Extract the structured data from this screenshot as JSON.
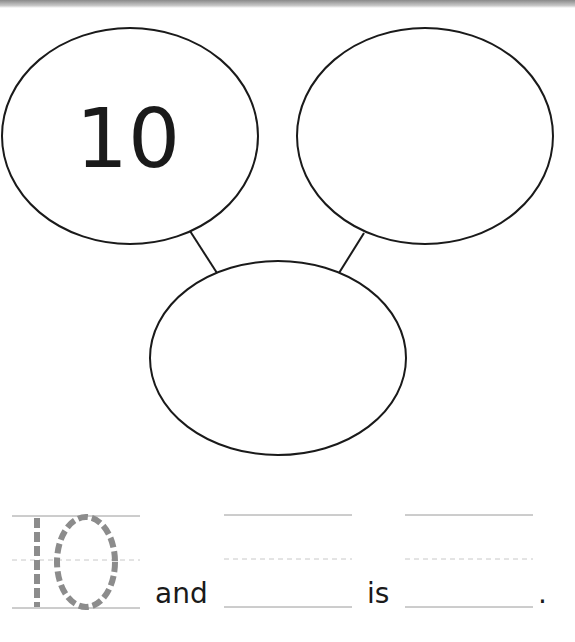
{
  "worksheet": {
    "top_left_circle_value": "10",
    "top_right_circle_value": "",
    "bottom_circle_value": "",
    "sentence": {
      "traced_number": "10",
      "word_and": "and",
      "word_is": "is",
      "period": "."
    }
  },
  "colors": {
    "line": "#1a1a1a",
    "trace": "#8c8c8c",
    "guide": "#bdbdbd"
  }
}
